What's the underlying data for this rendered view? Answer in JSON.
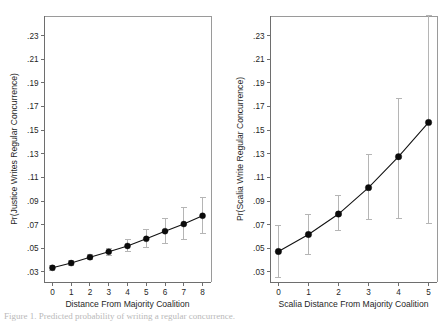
{
  "figure": {
    "background_color": "#ffffff",
    "marker_color": "#0b0b0b",
    "line_color": "#111111",
    "errorbar_color": "#b5b5b5",
    "frame_color": "#9a9a9a",
    "caption_partial": "Figure 1. Predicted probability of writing a regular concurrence."
  },
  "chart_data": [
    {
      "type": "scatter",
      "panel": "left",
      "title": "",
      "xlabel": "Distance From Majority Coalition",
      "ylabel": "Pr(Justice Writes Regular Concurrence)",
      "xlim": [
        -0.45,
        8.45
      ],
      "ylim": [
        0.0215,
        0.2465
      ],
      "xticks": [
        0,
        1,
        2,
        3,
        4,
        5,
        6,
        7,
        8
      ],
      "xticklabels": [
        "0",
        "1",
        "2",
        "3",
        "4",
        "5",
        "6",
        "7",
        "8"
      ],
      "yticks": [
        0.03,
        0.05,
        0.07,
        0.09,
        0.11,
        0.13,
        0.15,
        0.17,
        0.19,
        0.21,
        0.23
      ],
      "yticklabels": [
        ".03",
        ".05",
        ".07",
        ".09",
        ".11",
        ".13",
        ".15",
        ".17",
        ".19",
        ".21",
        ".23"
      ],
      "grid": false,
      "legend": "none",
      "x": [
        0,
        1,
        2,
        3,
        4,
        5,
        6,
        7,
        8
      ],
      "values": [
        0.0335,
        0.0375,
        0.0425,
        0.047,
        0.052,
        0.058,
        0.0645,
        0.0705,
        0.0775
      ],
      "error_low": [
        0.0315,
        0.0358,
        0.0405,
        0.044,
        0.0473,
        0.0508,
        0.0543,
        0.0578,
        0.0622
      ],
      "error_high": [
        0.0355,
        0.0393,
        0.0447,
        0.0502,
        0.0572,
        0.0655,
        0.0752,
        0.0845,
        0.0932
      ],
      "connector": "line"
    },
    {
      "type": "scatter",
      "panel": "right",
      "title": "",
      "xlabel": "Scalia Distance From Majority Coalition",
      "ylabel": "Pr(Scalia Write Regular Concurrence)",
      "xlim": [
        -0.28,
        5.28
      ],
      "ylim": [
        0.0215,
        0.2465
      ],
      "xticks": [
        0,
        1,
        2,
        3,
        4,
        5
      ],
      "xticklabels": [
        "0",
        "1",
        "2",
        "3",
        "4",
        "5"
      ],
      "yticks": [
        0.03,
        0.05,
        0.07,
        0.09,
        0.11,
        0.13,
        0.15,
        0.17,
        0.19,
        0.21,
        0.23
      ],
      "yticklabels": [
        ".03",
        ".05",
        ".07",
        ".09",
        ".11",
        ".13",
        ".15",
        ".17",
        ".19",
        ".21",
        ".23"
      ],
      "grid": false,
      "legend": "none",
      "x": [
        0,
        1,
        2,
        3,
        4,
        5
      ],
      "values": [
        0.0473,
        0.0617,
        0.079,
        0.1013,
        0.1275,
        0.1565
      ],
      "error_low": [
        0.0253,
        0.0448,
        0.065,
        0.074,
        0.0752,
        0.071
      ],
      "error_high": [
        0.0695,
        0.079,
        0.0945,
        0.129,
        0.1765,
        0.247
      ],
      "connector": "line"
    }
  ]
}
